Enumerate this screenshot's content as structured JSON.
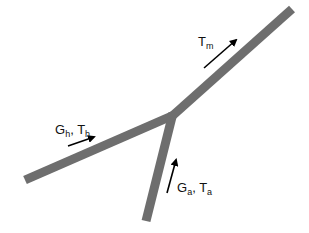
{
  "diagram": {
    "type": "pipe-junction",
    "colors": {
      "pipe": "#6e6e6e",
      "arrow": "#000000",
      "background": "#ffffff"
    },
    "branches": [
      {
        "id": "hot-inlet",
        "from": [
          25,
          180
        ],
        "to": [
          173,
          115
        ]
      },
      {
        "id": "air-inlet",
        "from": [
          146,
          220
        ],
        "to": [
          173,
          115
        ]
      },
      {
        "id": "mixed-outlet",
        "from": [
          173,
          115
        ],
        "to": [
          290,
          10
        ]
      }
    ],
    "labels": {
      "outlet": {
        "main": "T",
        "sub": "m"
      },
      "hot": {
        "g_main": "G",
        "g_sub": "h",
        "sep": ", ",
        "t_main": "T",
        "t_sub": "h"
      },
      "air": {
        "g_main": "G",
        "g_sub": "a",
        "sep": ", ",
        "t_main": "T",
        "t_sub": "a"
      }
    },
    "arrows": [
      {
        "id": "outlet-flow",
        "from": [
          204,
          68
        ],
        "to": [
          238,
          38
        ]
      },
      {
        "id": "hot-flow",
        "from": [
          68,
          146
        ],
        "to": [
          96,
          136
        ]
      },
      {
        "id": "air-flow",
        "from": [
          167,
          193
        ],
        "to": [
          177,
          158
        ]
      }
    ]
  }
}
